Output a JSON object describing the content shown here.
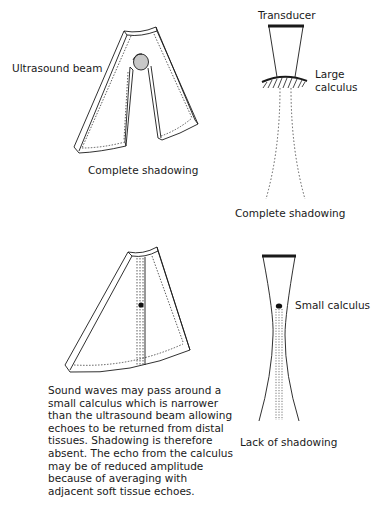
{
  "panels": {
    "top_left": {
      "beam_label": "Ultrasound beam",
      "caption": "Complete shadowing",
      "calculus_fill": "#c8c8c8"
    },
    "top_right": {
      "transducer_label": "Transducer",
      "calculus_label_line1": "Large",
      "calculus_label_line2": "calculus",
      "caption": "Complete shadowing"
    },
    "bottom_left": {
      "explanation_lines": [
        "Sound waves may pass around a",
        "small calculus which is narrower",
        "than the ultrasound beam allowing",
        "echoes to be returned from distal",
        "tissues. Shadowing is therefore",
        "absent. The echo from the calculus",
        "may be of reduced amplitude",
        "because of averaging with",
        "adjacent soft tissue echoes."
      ]
    },
    "bottom_right": {
      "calculus_label": "Small calculus",
      "caption": "Lack of shadowing"
    }
  }
}
